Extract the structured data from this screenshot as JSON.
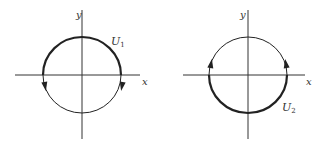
{
  "diagrams": [
    {
      "id": "left",
      "axis_x_label": "x",
      "axis_y_label": "y",
      "curve_label": "U",
      "curve_subscript": "1",
      "highlighted_arc": "upper half (thick)",
      "arrows": "downward on both sides"
    },
    {
      "id": "right",
      "axis_x_label": "x",
      "axis_y_label": "y",
      "curve_label": "U",
      "curve_subscript": "2",
      "highlighted_arc": "lower half (thick)",
      "arrows": "upward on both sides"
    }
  ],
  "colors": {
    "stroke": "#222222",
    "axis": "#333333"
  }
}
